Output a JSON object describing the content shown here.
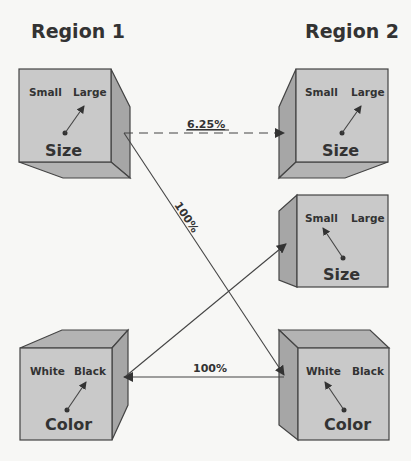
{
  "titles": {
    "region1": "Region 1",
    "region2": "Region 2"
  },
  "cubes": {
    "r1_size": {
      "left": "Small",
      "right": "Large",
      "dimension": "Size",
      "arrow_points_to": "Large"
    },
    "r2_size_top": {
      "left": "Small",
      "right": "Large",
      "dimension": "Size",
      "arrow_points_to": "Large"
    },
    "r2_size_mid": {
      "left": "Small",
      "right": "Large",
      "dimension": "Size",
      "arrow_points_to": "Small"
    },
    "r1_color": {
      "left": "White",
      "right": "Black",
      "dimension": "Color",
      "arrow_points_to": "Black"
    },
    "r2_color": {
      "left": "White",
      "right": "Black",
      "dimension": "Color",
      "arrow_points_to": "White"
    }
  },
  "connections": [
    {
      "from": "r1_size",
      "to": "r2_size_top",
      "label": "6.25%",
      "style": "dashed"
    },
    {
      "from": "r1_size",
      "to": "r2_color",
      "label": "100%",
      "style": "solid"
    },
    {
      "from": "r2_color",
      "to": "r1_color",
      "label": "100%",
      "style": "solid"
    },
    {
      "from": "r1_color",
      "to": "r2_size_mid",
      "label": "",
      "style": "solid"
    }
  ],
  "colors": {
    "front": "#c9c9c9",
    "side": "#a6a6a6",
    "stroke": "#444444",
    "text": "#333333"
  }
}
